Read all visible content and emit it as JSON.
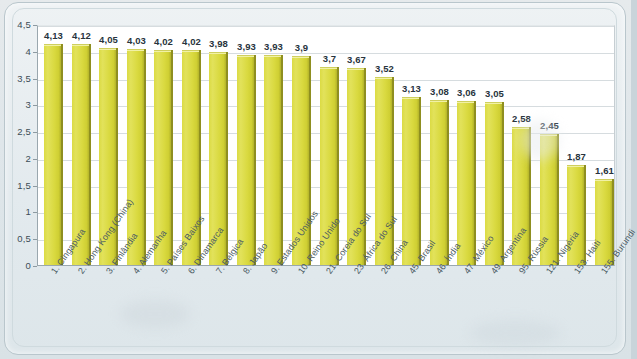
{
  "figure": {
    "background_color": "#e3eaee",
    "plot_background": "#ffffff",
    "bar_color": "#d9d93f",
    "bar_edge_color": "#8f8f20",
    "grid_color": "#d6dcdf",
    "axis_color": "#9aa7ae",
    "label_color": "#27333d"
  },
  "chart_data": {
    "type": "bar",
    "title": "",
    "xlabel": "",
    "ylabel": "",
    "ylim": [
      0,
      4.5
    ],
    "ytick_step": 0.5,
    "grid": true,
    "legend": false,
    "decimal_separator": ",",
    "ytick_labels": [
      "0",
      "0,5",
      "1",
      "1,5",
      "2",
      "2,5",
      "3",
      "3,5",
      "4",
      "4,5"
    ],
    "ytick_values": [
      0,
      0.5,
      1,
      1.5,
      2,
      2.5,
      3,
      3.5,
      4,
      4.5
    ],
    "categories": [
      "1. Cingapura",
      "2. Hong Kong (China)",
      "3. Finlândia",
      "4. Alemanha",
      "5. Países Baixos",
      "6. Dinamarca",
      "7. Bélgica",
      "8. Japão",
      "9. Estados Unidos",
      "10. Reino Unido",
      "21. Coreia do Sul",
      "23. África do Sul",
      "26. China",
      "45. Brasil",
      "46. Índia",
      "47. México",
      "49. Argentina",
      "95. Rússia",
      "121. Nigéria",
      "153. Haiti",
      "155. Burundi"
    ],
    "values": [
      4.13,
      4.12,
      4.05,
      4.03,
      4.02,
      4.02,
      3.98,
      3.93,
      3.93,
      3.9,
      3.7,
      3.67,
      3.52,
      3.13,
      3.08,
      3.06,
      3.05,
      2.58,
      2.45,
      1.87,
      1.61
    ],
    "value_labels": [
      "4,13",
      "4,12",
      "4,05",
      "4,03",
      "4,02",
      "4,02",
      "3,98",
      "3,93",
      "3,93",
      "3,9",
      "3,7",
      "3,67",
      "3,52",
      "3,13",
      "3,08",
      "3,06",
      "3,05",
      "2,58",
      "2,45",
      "1,87",
      "1,61"
    ]
  }
}
